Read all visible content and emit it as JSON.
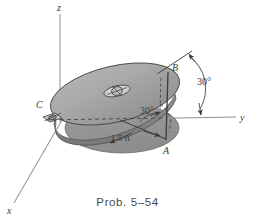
{
  "figure": {
    "caption": "Prob. 5–54",
    "axes": {
      "z_label": "z",
      "y_label": "y",
      "x_label": "x"
    },
    "points": {
      "a_label": "A",
      "b_label": "B",
      "c_label": "C"
    },
    "angles": {
      "outer": "30°",
      "inner": "30°"
    },
    "dimensions": {
      "radius": "1.5 ft"
    },
    "colors": {
      "disk_fill": "#a8a8a8",
      "shadow_fill": "#9a9a9a",
      "stroke": "#3a3a3a",
      "axis": "#8a8a8a",
      "background": "#ffffff"
    },
    "icons": {
      "bearing": "bearing-support-icon",
      "hub": "disk-hub-icon"
    }
  }
}
